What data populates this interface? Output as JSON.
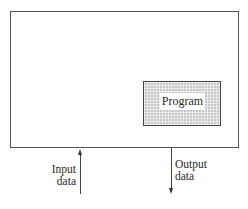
{
  "diagram": {
    "outer_box": {
      "label": ""
    },
    "program_box": {
      "label": "Program",
      "fill_pattern": "gray-crosshatch",
      "border_color": "#444444",
      "fill_color": "#c8c8c8"
    },
    "input_arrow": {
      "direction": "up",
      "label_line1": "Input",
      "label_line2": "data"
    },
    "output_arrow": {
      "direction": "down",
      "label_line1": "Output",
      "label_line2": "data"
    }
  }
}
